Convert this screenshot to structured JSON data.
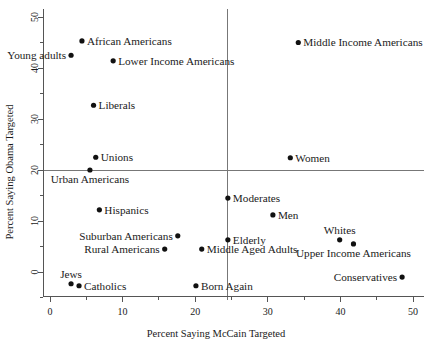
{
  "chart_data": {
    "type": "scatter",
    "title": "",
    "xlabel": "Percent Saying McCain Targeted",
    "ylabel": "Percent Saying Obama Targeted",
    "xlim": [
      -1.5,
      51.5
    ],
    "ylim": [
      -5.5,
      51.5
    ],
    "xticks": [
      0,
      10,
      20,
      30,
      40,
      50
    ],
    "yticks": [
      0,
      10,
      20,
      30,
      40,
      50
    ],
    "xminorticks": [
      5,
      15,
      25,
      35,
      45
    ],
    "yminorticks": [
      -5,
      5,
      15,
      25,
      35,
      45
    ],
    "xticklabels": [
      "0",
      "10",
      "20",
      "30",
      "40",
      "50"
    ],
    "yticklabels": [
      "0",
      "10",
      "20",
      "30",
      "40",
      "50"
    ],
    "grid": false,
    "legend": false,
    "reference_lines": [
      {
        "name": "horizontal-mean-line",
        "orientation": "horizontal",
        "value": 20.0
      },
      {
        "name": "vertical-mean-line",
        "orientation": "vertical",
        "value": 24.5
      }
    ],
    "points": [
      {
        "label": "African Americans",
        "x": 4.4,
        "y": 45.3,
        "label_pos": "right"
      },
      {
        "label": "Young adults",
        "x": 2.9,
        "y": 42.5,
        "label_pos": "left"
      },
      {
        "label": "Lower Income Americans",
        "x": 8.7,
        "y": 41.4,
        "label_pos": "right"
      },
      {
        "label": "Middle Income Americans",
        "x": 34.2,
        "y": 45.0,
        "label_pos": "right"
      },
      {
        "label": "Liberals",
        "x": 6.0,
        "y": 32.7,
        "label_pos": "right"
      },
      {
        "label": "Unions",
        "x": 6.3,
        "y": 22.5,
        "label_pos": "right"
      },
      {
        "label": "Urban Americans",
        "x": 5.5,
        "y": 20.0,
        "label_pos": "below"
      },
      {
        "label": "Women",
        "x": 33.1,
        "y": 22.4,
        "label_pos": "right"
      },
      {
        "label": "Moderates",
        "x": 24.5,
        "y": 14.5,
        "label_pos": "right"
      },
      {
        "label": "Men",
        "x": 30.7,
        "y": 11.2,
        "label_pos": "right"
      },
      {
        "label": "Hispanics",
        "x": 6.8,
        "y": 12.2,
        "label_pos": "right"
      },
      {
        "label": "Suburban Americans",
        "x": 17.6,
        "y": 7.1,
        "label_pos": "left"
      },
      {
        "label": "Rural Americans",
        "x": 15.8,
        "y": 4.5,
        "label_pos": "left"
      },
      {
        "label": "Elderly",
        "x": 24.5,
        "y": 6.3,
        "label_pos": "right"
      },
      {
        "label": "Middle Aged Adults",
        "x": 20.9,
        "y": 4.5,
        "label_pos": "right"
      },
      {
        "label": "Whites",
        "x": 39.9,
        "y": 6.3,
        "label_pos": "above"
      },
      {
        "label": "Upper Income Americans",
        "x": 41.8,
        "y": 5.5,
        "label_pos": "below"
      },
      {
        "label": "Jews",
        "x": 2.9,
        "y": -2.3,
        "label_pos": "above"
      },
      {
        "label": "Catholics",
        "x": 4.0,
        "y": -2.7,
        "label_pos": "right"
      },
      {
        "label": "Born Again",
        "x": 20.1,
        "y": -2.7,
        "label_pos": "right"
      },
      {
        "label": "Conservatives",
        "x": 48.5,
        "y": -1.0,
        "label_pos": "left"
      }
    ]
  },
  "figure": {
    "caption_fragment": ""
  },
  "colors": {
    "point": "#111111",
    "axis": "#555555",
    "reference": "#777777",
    "text": "#1a1a1a",
    "background": "#ffffff"
  }
}
